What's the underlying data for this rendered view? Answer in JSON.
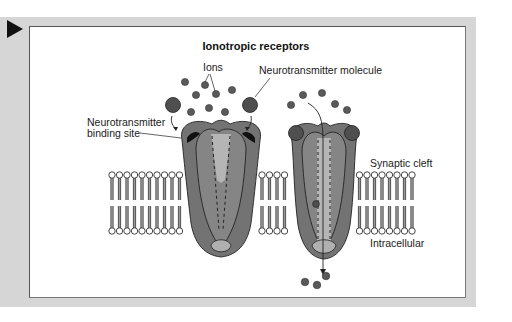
{
  "figure": {
    "title": "Ionotropic receptors",
    "labels": {
      "ions": "Ions",
      "neurotransmitter_molecule": "Neurotransmitter molecule",
      "binding_site_line1": "Neurotransmitter",
      "binding_site_line2": "binding site",
      "synaptic_cleft": "Synaptic cleft",
      "intracellular": "Intracellular"
    },
    "navigation": {
      "play_icon": "play-triangle-icon"
    },
    "colors": {
      "frame": "#d6d6d6",
      "panel": "#ffffff",
      "receptor_dark": "#6e6e6e",
      "receptor_mid": "#8a8a8a",
      "channel_light": "#b4b4b4",
      "ion": "#555555",
      "membrane_tail": "#8c8c8c"
    }
  }
}
